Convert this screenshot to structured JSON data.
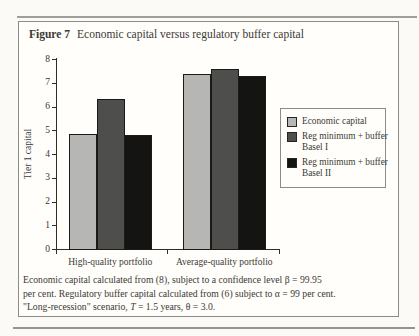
{
  "figure": {
    "label": "Figure 7",
    "title": "Economic capital versus regulatory buffer capital"
  },
  "chart_data": {
    "type": "bar",
    "title": "Economic capital versus regulatory buffer capital",
    "xlabel": "",
    "ylabel": "Tier 1 capital",
    "ylim": [
      0,
      8
    ],
    "ytick_step": 1,
    "grid": false,
    "legend_position": "right",
    "categories": [
      "High-quality portfolio",
      "Average-quality portfolio"
    ],
    "series": [
      {
        "name": "Economic capital",
        "color": "#b6b6b4",
        "values": [
          4.85,
          7.35
        ]
      },
      {
        "name": "Reg minimum + buffer Basel I",
        "color": "#4e4e4c",
        "values": [
          6.3,
          7.6
        ]
      },
      {
        "name": "Reg minimum + buffer Basel II",
        "color": "#141413",
        "values": [
          4.8,
          7.3
        ]
      }
    ]
  },
  "legend": {
    "items": [
      {
        "line1": "Economic capital",
        "line2": "",
        "color": "#b6b6b4"
      },
      {
        "line1": "Reg minimum + buffer",
        "line2": "Basel I",
        "color": "#4e4e4c"
      },
      {
        "line1": "Reg minimum + buffer",
        "line2": "Basel II",
        "color": "#141413"
      }
    ]
  },
  "caption": {
    "lines": [
      [
        {
          "t": "Economic capital calculated from (8), subject to a confidence level β = 99.95"
        }
      ],
      [
        {
          "t": "per cent. Regulatory buffer capital calculated from (6) subject to α = 99 per cent."
        }
      ],
      [
        {
          "t": "\"Long-recession\" scenario, "
        },
        {
          "t": "T",
          "i": true
        },
        {
          "t": " = 1.5 years, θ = 3.0."
        }
      ]
    ]
  }
}
